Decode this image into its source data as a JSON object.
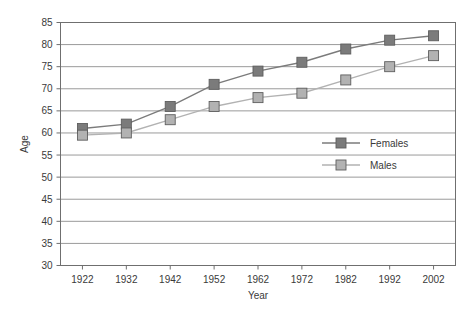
{
  "chart_data": {
    "type": "line",
    "title": "",
    "xlabel": "Year",
    "ylabel": "Age",
    "categories": [
      1922,
      1932,
      1942,
      1952,
      1962,
      1972,
      1982,
      1992,
      2002
    ],
    "xticklabels": [
      "1922",
      "1932",
      "1942",
      "1952",
      "1962",
      "1972",
      "1982",
      "1992",
      "2002"
    ],
    "yticklabels": [
      "30",
      "35",
      "40",
      "45",
      "50",
      "55",
      "60",
      "65",
      "70",
      "75",
      "80",
      "85"
    ],
    "yticks": [
      30,
      35,
      40,
      45,
      50,
      55,
      60,
      65,
      70,
      75,
      80,
      85
    ],
    "ylim": [
      30,
      85
    ],
    "xlim": [
      1917,
      2007
    ],
    "grid": "horizontal",
    "legend_position": "center-right",
    "series": [
      {
        "name": "Females",
        "color": "#7b7b7b",
        "marker": "square",
        "values": [
          61,
          62,
          66,
          71,
          74,
          76,
          79,
          81,
          82
        ]
      },
      {
        "name": "Males",
        "color": "#b2b2b2",
        "marker": "square",
        "values": [
          59.5,
          60,
          63,
          66,
          68,
          69,
          72,
          75,
          77.5
        ]
      }
    ]
  },
  "legend": {
    "items": [
      {
        "label": "Females"
      },
      {
        "label": "Males"
      }
    ]
  },
  "axes": {
    "x_title": "Year",
    "y_title": "Age"
  },
  "colors": {
    "females": "#7b7b7b",
    "males": "#b2b2b2",
    "grid": "#9a9a9a",
    "frame": "#6f6f6f",
    "text": "#3a3a3a",
    "background": "#ffffff"
  }
}
